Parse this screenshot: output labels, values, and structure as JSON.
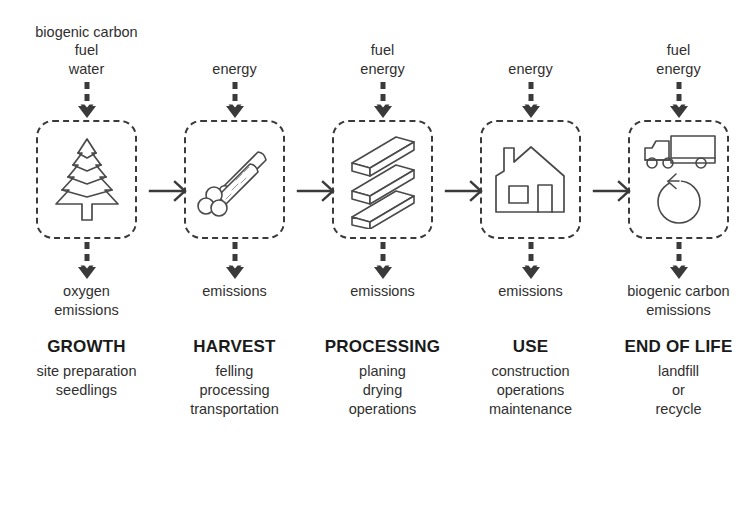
{
  "diagram": {
    "colors": {
      "stroke": "#3a3a3a",
      "text": "#2f2f2f",
      "heading": "#1a1a1a",
      "background": "#ffffff"
    },
    "stages": [
      {
        "id": "growth",
        "inputs": [
          "biogenic carbon",
          "fuel",
          "water"
        ],
        "icon": "pine-tree-icon",
        "outputs": [
          "oxygen",
          "emissions"
        ],
        "title": "GROWTH",
        "activities": [
          "site preparation",
          "seedlings"
        ]
      },
      {
        "id": "harvest",
        "inputs": [
          "energy"
        ],
        "icon": "logs-icon",
        "outputs": [
          "emissions"
        ],
        "title": "HARVEST",
        "activities": [
          "felling",
          "processing",
          "transportation"
        ]
      },
      {
        "id": "processing",
        "inputs": [
          "fuel",
          "energy"
        ],
        "icon": "lumber-planks-icon",
        "outputs": [
          "emissions"
        ],
        "title": "PROCESSING",
        "activities": [
          "planing",
          "drying",
          "operations"
        ]
      },
      {
        "id": "use",
        "inputs": [
          "energy"
        ],
        "icon": "house-icon",
        "outputs": [
          "emissions"
        ],
        "title": "USE",
        "activities": [
          "construction",
          "operations",
          "maintenance"
        ]
      },
      {
        "id": "end-of-life",
        "inputs": [
          "fuel",
          "energy"
        ],
        "icon": "truck-recycle-icon",
        "outputs": [
          "biogenic carbon",
          "emissions"
        ],
        "title": "END OF LIFE",
        "activities": [
          "landfill",
          "or",
          "recycle"
        ]
      }
    ]
  }
}
